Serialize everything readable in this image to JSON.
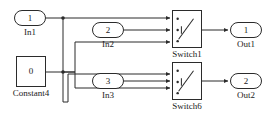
{
  "diagram": {
    "stroke_color": "#2b2b2b",
    "text_color": "#1a1a1a",
    "background": "#ffffff"
  },
  "blocks": {
    "in1": {
      "port_number": "1",
      "label": "In1",
      "type": "inport"
    },
    "in2": {
      "port_number": "2",
      "label": "In2",
      "type": "inport"
    },
    "in3": {
      "port_number": "3",
      "label": "In3",
      "type": "inport"
    },
    "const4": {
      "value": "0",
      "label": "Constant4",
      "type": "constant"
    },
    "switch1": {
      "label": "Switch1",
      "type": "switch"
    },
    "switch6": {
      "label": "Switch6",
      "type": "switch"
    },
    "out1": {
      "port_number": "1",
      "label": "Out1",
      "type": "outport"
    },
    "out2": {
      "port_number": "2",
      "label": "Out2",
      "type": "outport"
    }
  },
  "signals": [
    {
      "name": "in1-to-switch1-input1",
      "from": "In1",
      "to": "Switch1 port 1"
    },
    {
      "name": "in1-branch-to-switch6",
      "from": "In1",
      "to": "Switch6 port 1"
    },
    {
      "name": "in2-to-switch1-input2",
      "from": "In2",
      "to": "Switch1 port 2"
    },
    {
      "name": "constant4-to-switch1",
      "from": "Constant4",
      "to": "Switch1 port 3"
    },
    {
      "name": "constant4-to-switch6",
      "from": "Constant4",
      "to": "Switch6 port 3"
    },
    {
      "name": "in3-to-switch6-input2",
      "from": "In3",
      "to": "Switch6 port 2"
    },
    {
      "name": "switch1-to-out1",
      "from": "Switch1",
      "to": "Out1"
    },
    {
      "name": "switch6-to-out2",
      "from": "Switch6",
      "to": "Out2"
    }
  ]
}
